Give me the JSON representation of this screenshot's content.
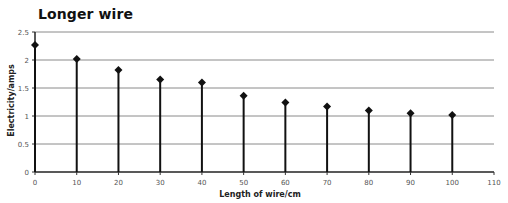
{
  "chart_data": {
    "type": "scatter",
    "style": "stem",
    "title": "Longer wire",
    "xlabel": "Length of wire/cm",
    "ylabel": "Electricity/amps",
    "x": [
      0,
      10,
      20,
      30,
      40,
      50,
      60,
      70,
      80,
      90,
      100
    ],
    "series": [
      {
        "name": "Electricity",
        "values": [
          2.27,
          2.02,
          1.82,
          1.65,
          1.6,
          1.36,
          1.24,
          1.17,
          1.1,
          1.05,
          1.02
        ]
      }
    ],
    "xlim": [
      0,
      110
    ],
    "ylim": [
      0,
      2.5
    ],
    "xticks": [
      "0",
      "10",
      "20",
      "30",
      "40",
      "50",
      "60",
      "70",
      "80",
      "90",
      "100",
      "110"
    ],
    "yticks": [
      "0",
      "0.5",
      "1",
      "1.5",
      "2",
      "2.5"
    ],
    "grid": "horizontal",
    "legend": "none"
  }
}
